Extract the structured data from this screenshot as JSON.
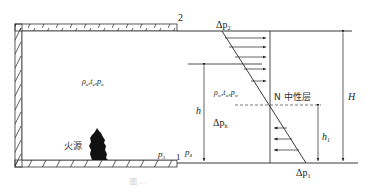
{
  "diagram": {
    "type": "stack-effect-pressure-distribution",
    "labels": {
      "opening_top": "2",
      "opening_bottom": "1",
      "delta_p2": "Δp",
      "delta_p2_sub": "2",
      "delta_p1": "Δp",
      "delta_p1_sub": "1",
      "delta_ph": "Δp",
      "delta_ph_sub": "h",
      "inside_props": "ρ",
      "inside_props_sub": "u",
      "inside_t": "t",
      "inside_t_sub": "u",
      "inside_p": "p",
      "inside_p_sub": "u",
      "outside_props": "ρ",
      "outside_props_sub": "w",
      "outside_t": "t",
      "outside_t_sub": "w",
      "outside_p": "p",
      "outside_p_sub": "w",
      "neutral_layer": "N 中性层",
      "H": "H",
      "h": "h",
      "h1": "h",
      "h1_sub": "1",
      "p3": "p",
      "p3_sub": "3",
      "p4": "p",
      "p4_sub": "4",
      "fire_source": "火源"
    },
    "caption": "图 …"
  }
}
